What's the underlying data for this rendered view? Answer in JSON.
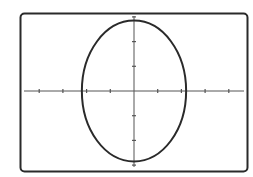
{
  "chart_data": {
    "type": "line",
    "title": "",
    "xlabel": "",
    "ylabel": "",
    "equation": "x^2/2.2^2 + y^2/2.85^2 = 1",
    "series": [
      {
        "name": "ellipse",
        "center": [
          0,
          0
        ],
        "semi_axis_x": 2.2,
        "semi_axis_y": 2.85
      }
    ],
    "xlim": [
      -4.75,
      4.75
    ],
    "ylim": [
      -3.1,
      3.1
    ],
    "x_ticks": [
      -4,
      -3,
      -2,
      -1,
      1,
      2,
      3,
      4
    ],
    "y_ticks": [
      -3,
      -2,
      -1,
      1,
      2,
      3
    ],
    "grid": false,
    "legend": "none",
    "colors": {
      "curve": "#2a2a2a",
      "axes": "#555555",
      "frame": "#2a2a2a",
      "background": "#ffffff"
    }
  }
}
